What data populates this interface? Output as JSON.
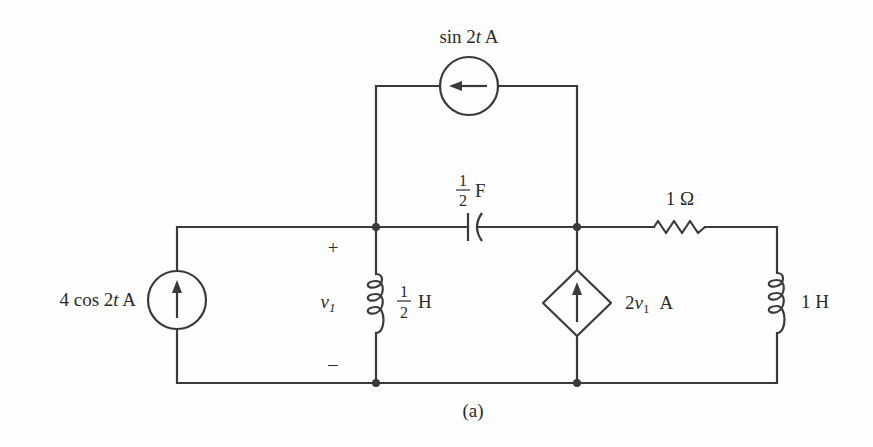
{
  "figure": {
    "caption": "(a)",
    "colors": {
      "ink": "#3a3a3a",
      "background": "#fefefe"
    }
  },
  "components": {
    "top_source": {
      "type": "independent-current-source",
      "direction": "left",
      "label_prefix": "sin 2",
      "label_var": "t",
      "label_unit": " A"
    },
    "left_source": {
      "type": "independent-current-source",
      "direction": "up",
      "label_prefix": "4 cos 2",
      "label_var": "t",
      "label_unit": " A"
    },
    "capacitor": {
      "type": "capacitor",
      "value_num": "1",
      "value_den": "2",
      "unit": "F"
    },
    "resistor": {
      "type": "resistor",
      "label": "1 Ω"
    },
    "inductor_mid": {
      "type": "inductor",
      "value_num": "1",
      "value_den": "2",
      "unit": "H"
    },
    "inductor_right": {
      "type": "inductor",
      "label": "1 H"
    },
    "dependent_source": {
      "type": "dependent-current-source",
      "direction": "up",
      "label_coef": "2",
      "label_var": "v",
      "label_sub": "1",
      "label_unit": "A"
    },
    "voltage_v1": {
      "plus": "+",
      "minus": "–",
      "var": "v",
      "sub": "1"
    }
  }
}
